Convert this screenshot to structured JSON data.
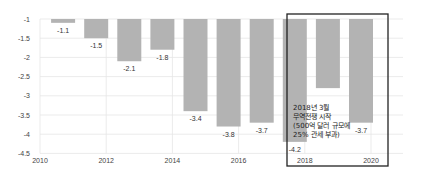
{
  "chart_data": {
    "type": "bar",
    "title": "",
    "xlabel": "",
    "ylabel": "",
    "x": [
      2011,
      2012,
      2013,
      2014,
      2015,
      2016,
      2017,
      2018,
      2019,
      2020
    ],
    "values": [
      -1.1,
      -1.5,
      -2.1,
      -1.8,
      -3.4,
      -3.8,
      -3.7,
      -4.2,
      -2.8,
      -3.7
    ],
    "value_labels": [
      "-1.1",
      "-1.5",
      "-2.1",
      "-1.8",
      "-3.4",
      "-3.8",
      "-3.7",
      "-4.2",
      "",
      "-3.7"
    ],
    "bar_baseline": -1,
    "ylim": [
      -4.5,
      -1
    ],
    "xlim": [
      2010,
      2021.3
    ],
    "y_ticks": [
      "-1",
      "-1.5",
      "-2",
      "-2.5",
      "-3",
      "-3.5",
      "-4",
      "-4.5"
    ],
    "x_ticks": [
      "2010",
      "2012",
      "2014",
      "2016",
      "2018",
      "2020"
    ],
    "grid": true,
    "bar_color": "#b3b3b3",
    "highlight_box": {
      "from": 2018,
      "to": 2020,
      "color": "#222222"
    },
    "annotation": {
      "lines": [
        "2018년 3월",
        "무역전쟁 시작",
        "(500억 달러 규모에",
        "25% 관세 부과)"
      ]
    }
  }
}
